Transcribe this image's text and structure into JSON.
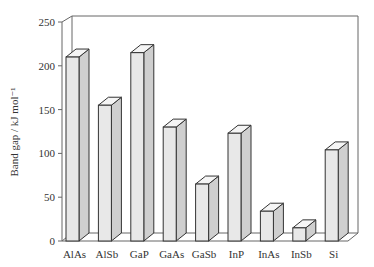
{
  "chart_data": {
    "type": "bar",
    "style": "3d",
    "title": "",
    "xlabel": "",
    "ylabel": "Band gap / kJ mol⁻¹",
    "ylim": [
      0,
      250
    ],
    "yticks": [
      0,
      50,
      100,
      150,
      200,
      250
    ],
    "grid": false,
    "legend": null,
    "categories": [
      "AlAs",
      "AlSb",
      "GaP",
      "GaAs",
      "GaSb",
      "InP",
      "InAs",
      "InSb",
      "Si"
    ],
    "values": [
      210,
      155,
      215,
      130,
      65,
      123,
      34,
      15,
      104
    ]
  },
  "colors": {
    "bar_front": "#e8e8e8",
    "bar_side": "#cfcfcf",
    "bar_top": "#f5f5f5",
    "outline": "#333333",
    "axis": "#666666"
  }
}
